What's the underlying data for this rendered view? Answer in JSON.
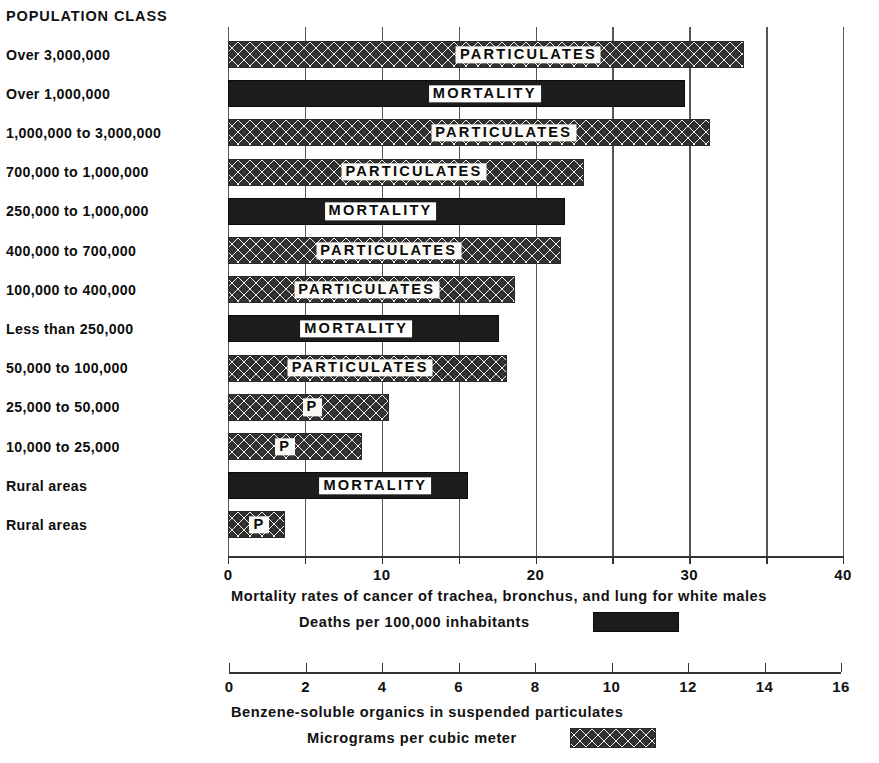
{
  "category_header": "POPULATION CLASS",
  "chart_data": {
    "type": "bar",
    "orientation": "horizontal",
    "title": "",
    "grid": true,
    "legend_position": "below",
    "categories": [
      "Over 3,000,000",
      "Over 1,000,000",
      "1,000,000 to 3,000,000",
      "700,000 to 1,000,000",
      "250,000 to 1,000,000",
      "400,000 to 700,000",
      "100,000 to 400,000",
      "Less than 250,000",
      "50,000 to 100,000",
      "25,000 to 50,000",
      "10,000 to 25,000",
      "Rural areas",
      "Rural areas"
    ],
    "series": [
      {
        "name": "Particulates",
        "unit": "Micrograms per cubic meter",
        "axis": "bottom-2",
        "axis_label": "Benzene-soluble organics in suspended particulates",
        "xlim": [
          0,
          16
        ],
        "ticks": [
          0,
          2,
          4,
          6,
          8,
          10,
          12,
          14,
          16
        ],
        "values": [
          13.5,
          null,
          12.6,
          9.3,
          null,
          8.7,
          7.5,
          null,
          7.3,
          4.2,
          3.5,
          null,
          1.5
        ]
      },
      {
        "name": "Mortality",
        "unit": "Deaths per 100,000 inhabitants",
        "axis": "bottom-1",
        "axis_label": "Mortality rates of cancer of trachea, bronchus, and lung for white males",
        "xlim": [
          0,
          42
        ],
        "ticks": [
          0,
          5,
          10,
          15,
          20,
          25,
          30,
          35,
          40
        ],
        "labeled_ticks": [
          0,
          10,
          20,
          30,
          40
        ],
        "values": [
          null,
          29.7,
          null,
          null,
          21.9,
          null,
          null,
          17.6,
          null,
          null,
          null,
          15.6,
          null
        ]
      }
    ]
  },
  "bars": [
    {
      "category": "Over 3,000,000",
      "series": "particulates",
      "value": 13.5,
      "label": "PARTICULATES",
      "label_pos": 0.58
    },
    {
      "category": "Over 1,000,000",
      "series": "mortality",
      "value": 29.7,
      "label": "MORTALITY",
      "label_pos": 0.56
    },
    {
      "category": "1,000,000 to 3,000,000",
      "series": "particulates",
      "value": 12.6,
      "label": "PARTICULATES",
      "label_pos": 0.57
    },
    {
      "category": "700,000 to 1,000,000",
      "series": "particulates",
      "value": 9.3,
      "label": "PARTICULATES",
      "label_pos": 0.52
    },
    {
      "category": "250,000 to 1,000,000",
      "series": "mortality",
      "value": 21.9,
      "label": "MORTALITY",
      "label_pos": 0.45
    },
    {
      "category": "400,000 to 700,000",
      "series": "particulates",
      "value": 8.7,
      "label": "PARTICULATES",
      "label_pos": 0.48
    },
    {
      "category": "100,000 to 400,000",
      "series": "particulates",
      "value": 7.5,
      "label": "PARTICULATES",
      "label_pos": 0.48
    },
    {
      "category": "Less than 250,000",
      "series": "mortality",
      "value": 17.6,
      "label": "MORTALITY",
      "label_pos": 0.47
    },
    {
      "category": "50,000 to 100,000",
      "series": "particulates",
      "value": 7.3,
      "label": "PARTICULATES",
      "label_pos": 0.47
    },
    {
      "category": "25,000 to 50,000",
      "series": "particulates",
      "value": 4.2,
      "label": "P",
      "label_pos": 0.52
    },
    {
      "category": "10,000 to 25,000",
      "series": "particulates",
      "value": 3.5,
      "label": "P",
      "label_pos": 0.42
    },
    {
      "category": "Rural areas",
      "series": "mortality",
      "value": 15.6,
      "label": "MORTALITY",
      "label_pos": 0.61
    },
    {
      "category": "Rural areas",
      "series": "particulates",
      "value": 1.5,
      "label": "P",
      "label_pos": 0.53
    }
  ],
  "axis1": {
    "ticks": [
      0,
      5,
      10,
      15,
      20,
      25,
      30,
      35,
      40
    ],
    "tick_labels": [
      "0",
      "",
      "10",
      "",
      "20",
      "",
      "30",
      "",
      "40"
    ],
    "caption": "Mortality rates of cancer of trachea, bronchus, and lung for white males",
    "legend_label": "Deaths per 100,000 inhabitants"
  },
  "axis2": {
    "ticks": [
      0,
      2,
      4,
      6,
      8,
      10,
      12,
      14,
      16
    ],
    "tick_labels": [
      "0",
      "2",
      "4",
      "6",
      "8",
      "10",
      "12",
      "14",
      "16"
    ],
    "caption": "Benzene-soluble organics in suspended particulates",
    "legend_label": "Micrograms per cubic meter"
  },
  "footer_partial": ""
}
